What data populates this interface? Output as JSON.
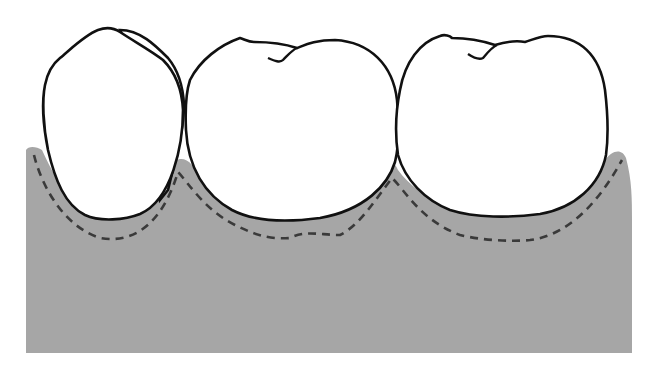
{
  "diagram": {
    "colors": {
      "background": "#ffffff",
      "gingiva": "#a6a6a6",
      "outline": "#111111",
      "dashed_line": "#3a3a3a",
      "tooth_fill": "#ffffff"
    },
    "elements": [
      {
        "name": "gingiva",
        "description": "gray gum tissue block"
      },
      {
        "name": "tooth-1",
        "description": "left premolar crown"
      },
      {
        "name": "tooth-2",
        "description": "middle molar crown"
      },
      {
        "name": "tooth-3",
        "description": "right molar crown"
      },
      {
        "name": "dashed-line",
        "description": "dashed contour below tooth crowns"
      }
    ]
  }
}
